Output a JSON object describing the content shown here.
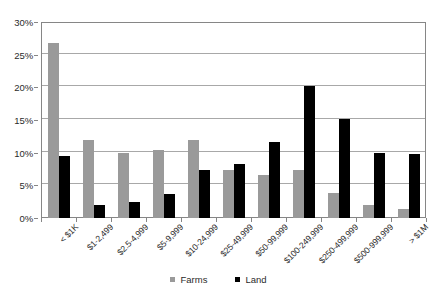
{
  "chart_data": {
    "type": "bar",
    "title": "",
    "subtitle": "",
    "xlabel": "",
    "ylabel": "",
    "ylim": [
      0,
      30
    ],
    "ytick_values": [
      0,
      5,
      10,
      15,
      20,
      25,
      30
    ],
    "ytick_labels": [
      "0%",
      "5%",
      "10%",
      "15%",
      "20%",
      "25%",
      "30%"
    ],
    "grid": true,
    "legend_position": "bottom",
    "categories": [
      "< $1K",
      "$1-2,499",
      "$2.5-4,999",
      "$5-9,999",
      "$10-24,999",
      "$25-49,999",
      "$50-99,999",
      "$100-249,999",
      "$250-499,999",
      "$500-999,999",
      "> $1M"
    ],
    "series": [
      {
        "name": "Farms",
        "color": "#9a9a9a",
        "values": [
          26.8,
          11.9,
          10.0,
          10.4,
          11.9,
          7.4,
          6.6,
          7.4,
          3.8,
          2.0,
          1.4
        ]
      },
      {
        "name": "Land",
        "color": "#000000",
        "values": [
          9.5,
          2.0,
          2.4,
          3.7,
          7.4,
          8.2,
          11.7,
          20.2,
          15.1,
          9.9,
          9.8
        ]
      }
    ]
  },
  "legend": {
    "items": [
      {
        "label": "Farms",
        "color": "#9a9a9a"
      },
      {
        "label": "Land",
        "color": "#000000"
      }
    ]
  }
}
